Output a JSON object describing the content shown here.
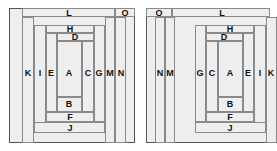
{
  "figure": {
    "type": "nested-rectangle-partition-pair",
    "background_color": "#ffffff",
    "fill_color": "#eeeeee",
    "line_color": "#8a8a8a",
    "outer_line_color": "#555555",
    "text_color": "#111111",
    "labels": [
      "A",
      "B",
      "C",
      "D",
      "E",
      "F",
      "G",
      "H",
      "I",
      "J",
      "K",
      "L",
      "M",
      "N",
      "O"
    ]
  },
  "left_diagram": {
    "name": "left-nesting",
    "frame": {
      "x": 9,
      "y": 8,
      "w": 126,
      "h": 135
    },
    "regions": [
      {
        "id": "A",
        "label": "A",
        "x": 57,
        "y": 41,
        "w": 25,
        "h": 56,
        "label_x": 69,
        "label_y": 73
      },
      {
        "id": "B",
        "label": "B",
        "x": 57,
        "y": 97,
        "w": 25,
        "h": 15,
        "label_x": 69,
        "label_y": 104
      },
      {
        "id": "C",
        "label": "C",
        "x": 82,
        "y": 41,
        "w": 12,
        "h": 71,
        "label_x": 88,
        "label_y": 73
      },
      {
        "id": "D",
        "label": "D",
        "x": 57,
        "y": 33,
        "w": 37,
        "h": 8,
        "label_x": 75,
        "label_y": 37
      },
      {
        "id": "E",
        "label": "E",
        "x": 46,
        "y": 33,
        "w": 11,
        "h": 79,
        "label_x": 51,
        "label_y": 73
      },
      {
        "id": "F",
        "label": "F",
        "x": 46,
        "y": 112,
        "w": 48,
        "h": 10,
        "label_x": 70,
        "label_y": 117
      },
      {
        "id": "G",
        "label": "G",
        "x": 94,
        "y": 25,
        "w": 11,
        "h": 97,
        "label_x": 99,
        "label_y": 73
      },
      {
        "id": "H",
        "label": "H",
        "x": 46,
        "y": 25,
        "w": 48,
        "h": 8,
        "label_x": 70,
        "label_y": 29
      },
      {
        "id": "I",
        "label": "I",
        "x": 34,
        "y": 25,
        "w": 12,
        "h": 108,
        "label_x": 40,
        "label_y": 73
      },
      {
        "id": "J",
        "label": "J",
        "x": 34,
        "y": 122,
        "w": 71,
        "h": 11,
        "label_x": 70,
        "label_y": 128
      },
      {
        "id": "K",
        "label": "K",
        "x": 22,
        "y": 17,
        "w": 12,
        "h": 126,
        "label_x": 28,
        "label_y": 73
      },
      {
        "id": "L",
        "label": "L",
        "x": 22,
        "y": 8,
        "w": 93,
        "h": 9,
        "label_x": 69,
        "label_y": 13
      },
      {
        "id": "M",
        "label": "M",
        "x": 105,
        "y": 17,
        "w": 10,
        "h": 126,
        "label_x": 110,
        "label_y": 73
      },
      {
        "id": "N",
        "label": "N",
        "x": 115,
        "y": 17,
        "w": 11,
        "h": 126,
        "label_x": 121,
        "label_y": 73
      },
      {
        "id": "O",
        "label": "O",
        "x": 115,
        "y": 8,
        "w": 20,
        "h": 9,
        "label_x": 125,
        "label_y": 13
      }
    ]
  },
  "right_diagram": {
    "name": "right-nesting",
    "frame": {
      "x": 146,
      "y": 8,
      "w": 124,
      "h": 135
    },
    "regions": [
      {
        "id": "A",
        "label": "A",
        "x": 218,
        "y": 41,
        "w": 25,
        "h": 56,
        "label_x": 230,
        "label_y": 73
      },
      {
        "id": "B",
        "label": "B",
        "x": 218,
        "y": 97,
        "w": 25,
        "h": 15,
        "label_x": 230,
        "label_y": 104
      },
      {
        "id": "C",
        "label": "C",
        "x": 206,
        "y": 41,
        "w": 12,
        "h": 71,
        "label_x": 212,
        "label_y": 73
      },
      {
        "id": "D",
        "label": "D",
        "x": 206,
        "y": 33,
        "w": 37,
        "h": 8,
        "label_x": 224,
        "label_y": 37
      },
      {
        "id": "E",
        "label": "E",
        "x": 243,
        "y": 33,
        "w": 11,
        "h": 79,
        "label_x": 248,
        "label_y": 73
      },
      {
        "id": "F",
        "label": "F",
        "x": 206,
        "y": 112,
        "w": 48,
        "h": 10,
        "label_x": 230,
        "label_y": 117
      },
      {
        "id": "G",
        "label": "G",
        "x": 195,
        "y": 25,
        "w": 11,
        "h": 97,
        "label_x": 200,
        "label_y": 73
      },
      {
        "id": "H",
        "label": "H",
        "x": 206,
        "y": 25,
        "w": 48,
        "h": 8,
        "label_x": 230,
        "label_y": 29
      },
      {
        "id": "I",
        "label": "I",
        "x": 254,
        "y": 25,
        "w": 12,
        "h": 108,
        "label_x": 260,
        "label_y": 73
      },
      {
        "id": "J",
        "label": "J",
        "x": 195,
        "y": 122,
        "w": 71,
        "h": 11,
        "label_x": 230,
        "label_y": 128
      },
      {
        "id": "K",
        "label": "K",
        "x": 266,
        "y": 17,
        "w": 11,
        "h": 126,
        "label_x": 271,
        "label_y": 73
      },
      {
        "id": "L",
        "label": "L",
        "x": 172,
        "y": 8,
        "w": 98,
        "h": 9,
        "label_x": 222,
        "label_y": 13
      },
      {
        "id": "M",
        "label": "M",
        "x": 165,
        "y": 17,
        "w": 10,
        "h": 126,
        "label_x": 170,
        "label_y": 73
      },
      {
        "id": "N",
        "label": "N",
        "x": 155,
        "y": 17,
        "w": 10,
        "h": 126,
        "label_x": 160,
        "label_y": 73
      },
      {
        "id": "O",
        "label": "O",
        "x": 146,
        "y": 8,
        "w": 26,
        "h": 9,
        "label_x": 159,
        "label_y": 13
      }
    ]
  }
}
